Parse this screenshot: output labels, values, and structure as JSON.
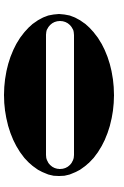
{
  "image": {
    "kind": "glyph-image",
    "description": "Bold fat-face letterform glyph on plain white background",
    "width": 124,
    "height": 187,
    "background_color": "#ffffff"
  },
  "glyph": {
    "character": "O",
    "alt_text": "O",
    "name": "letter-o-glyph",
    "style": "bold fat-face serif",
    "fill_color": "#000000",
    "counter_color": "#ffffff",
    "outer": {
      "shape": "ellipse",
      "center_x": 59,
      "center_y": 95,
      "radius_x": 55,
      "radius_y": 81,
      "left": 4,
      "top": 14,
      "right": 114,
      "bottom": 176,
      "width": 110,
      "height": 162
    },
    "counter": {
      "shape": "stadium",
      "center_x": 60,
      "center_y": 95,
      "left": 46,
      "top": 21,
      "right": 74,
      "bottom": 169,
      "width": 28,
      "height": 148,
      "corner_radius": 14
    }
  }
}
